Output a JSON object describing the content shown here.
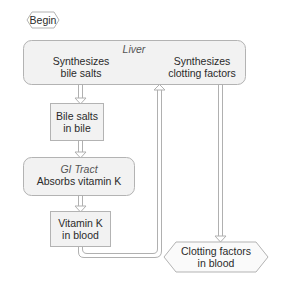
{
  "diagram": {
    "type": "flowchart",
    "colors": {
      "box_fill": "#f2f2f2",
      "box_stroke": "#b3b3b3",
      "arrow_stroke": "#b0b0b0",
      "arrow_fill": "#ffffff",
      "text": "#2a2a2a",
      "section_label": "#555555"
    },
    "nodes": {
      "begin": {
        "label": "Begin",
        "shape": "hexagon"
      },
      "liver": {
        "section_label": "Liver",
        "shape": "rounded-rect",
        "bile": {
          "line1": "Synthesizes",
          "line2": "bile salts"
        },
        "clotting": {
          "line1": "Synthesizes",
          "line2": "clotting factors"
        }
      },
      "bile_salts": {
        "line1": "Bile salts",
        "line2": "in bile",
        "shape": "rect"
      },
      "gi_tract": {
        "section_label": "GI Tract",
        "line1": "Absorbs vitamin K",
        "shape": "rounded-rect"
      },
      "vitamin_k": {
        "line1": "Vitamin K",
        "line2": "in blood",
        "shape": "rect"
      },
      "clotting_blood": {
        "line1": "Clotting factors",
        "line2": "in blood",
        "shape": "hexagon"
      }
    },
    "edges": [
      {
        "from": "liver.bile",
        "to": "bile_salts"
      },
      {
        "from": "bile_salts",
        "to": "gi_tract"
      },
      {
        "from": "gi_tract",
        "to": "vitamin_k"
      },
      {
        "from": "vitamin_k",
        "to": "liver.clotting"
      },
      {
        "from": "liver.clotting",
        "to": "clotting_blood"
      }
    ]
  }
}
